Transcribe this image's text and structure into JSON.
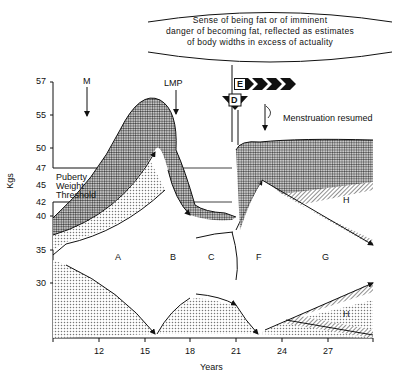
{
  "banner": {
    "line1": "Sense of being fat or of imminent",
    "line2": "danger of becoming fat, reflected as estimates",
    "line3": "of body widths in excess of actuality"
  },
  "axes": {
    "ylabel": "Kgs",
    "xlabel": "Years",
    "yticks": [
      "57",
      "55",
      "50",
      "47",
      "45",
      "42",
      "40",
      "35",
      "30"
    ],
    "xticks": [
      "12",
      "15",
      "18",
      "21",
      "24",
      "27"
    ]
  },
  "annotations": {
    "menarche": "M",
    "lmp": "LMP",
    "menstruation_resumed": "Menstruation resumed",
    "threshold_line1": "Puberty",
    "threshold_line2": "Weight",
    "threshold_line3": "Threshold",
    "marker_d": "D",
    "marker_e": "E"
  },
  "regions": {
    "a": "A",
    "b": "B",
    "c": "C",
    "f": "F",
    "g": "G",
    "h_upper": "H",
    "h_lower": "H"
  },
  "colors": {
    "ink": "#111111",
    "stipple": "#9a9a9a",
    "background": "#ffffff"
  }
}
